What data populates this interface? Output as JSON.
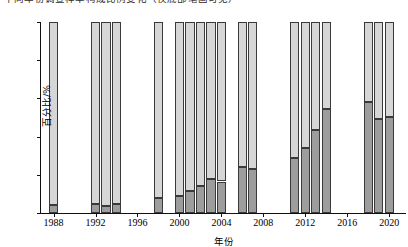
{
  "figure": {
    "caption_cropped": "不同年份调查样本构成比例变化（仅底部笔画可见）"
  },
  "axes": {
    "ylabel": "百分比/%",
    "xlabel": "年份",
    "yticks": [
      0,
      20,
      40,
      60,
      80,
      100
    ],
    "xticks": [
      1988,
      1992,
      1996,
      2000,
      2004,
      2008,
      2012,
      2016,
      2020
    ],
    "ylim": [
      0,
      100
    ],
    "xlim": [
      1986.8,
      2021.6
    ]
  },
  "colors": {
    "lower_segment": "#9d9d9d",
    "upper_segment": "#d6d6d6",
    "bar_outline": "#3a3a3a",
    "axis": "#111111"
  },
  "chart_data": {
    "type": "bar",
    "stacked": true,
    "normalized_to_100": true,
    "title": "",
    "xlabel": "年份",
    "ylabel": "百分比/%",
    "ylim": [
      0,
      100
    ],
    "grid": false,
    "legend": "none",
    "categories": [
      1988,
      1992,
      1993,
      1994,
      1998,
      2000,
      2001,
      2002,
      2003,
      2004,
      2006,
      2007,
      2011,
      2012,
      2013,
      2014,
      2018,
      2019,
      2020
    ],
    "series": [
      {
        "name": "下部（深灰）",
        "color": "#9d9d9d",
        "values": [
          4.0,
          4.5,
          3.5,
          4.7,
          8.0,
          9.0,
          11.5,
          14.0,
          18.0,
          16.5,
          24.0,
          23.0,
          28.8,
          34.0,
          43.5,
          54.5,
          58.0,
          49.0,
          50.5
        ]
      },
      {
        "name": "上部（浅灰）",
        "color": "#d6d6d6",
        "values": [
          96.0,
          95.5,
          96.5,
          95.3,
          92.0,
          91.0,
          88.5,
          86.0,
          82.0,
          83.5,
          76.0,
          77.0,
          71.2,
          66.0,
          56.5,
          45.5,
          42.0,
          51.0,
          49.5
        ]
      }
    ],
    "missing_years": [
      1989,
      1990,
      1991,
      1995,
      1996,
      1997,
      1999,
      2005,
      2008,
      2009,
      2010,
      2015,
      2016,
      2017
    ]
  }
}
